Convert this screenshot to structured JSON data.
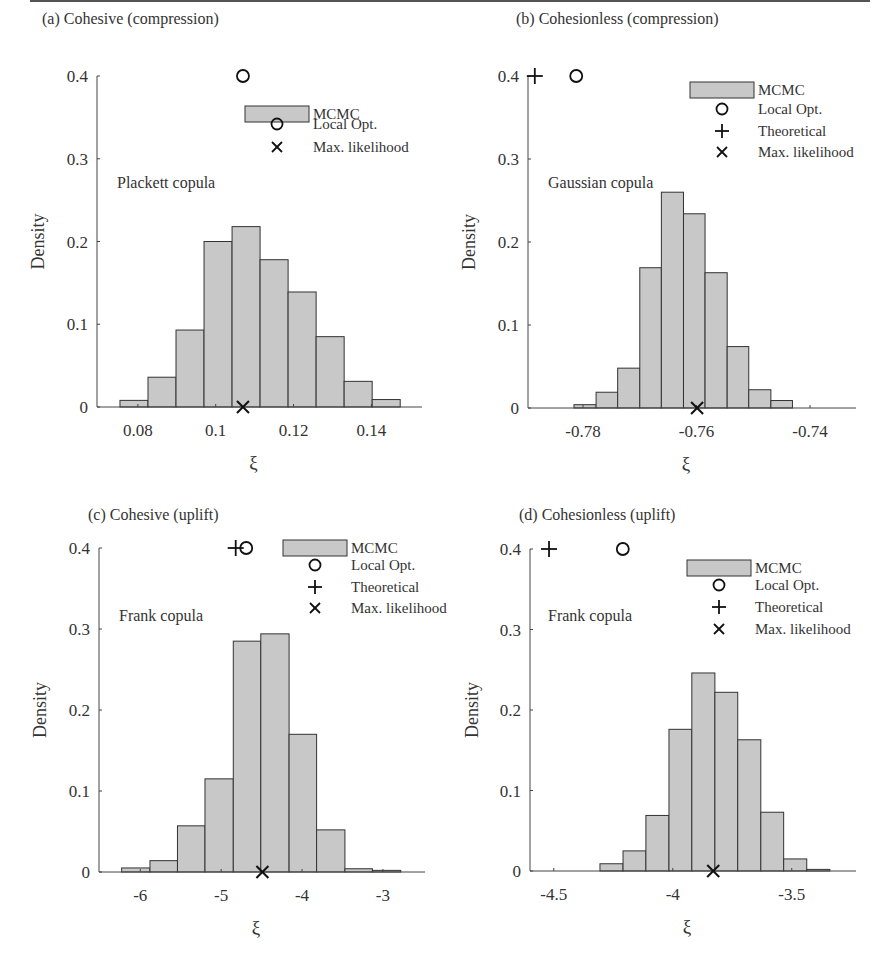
{
  "figure": {
    "ylabel": "Density",
    "xlabel": "ξ",
    "bar_fill": "#c8c8c8",
    "bar_stroke": "#333333",
    "legend": {
      "mcmc": "MCMC",
      "local_opt": "Local Opt.",
      "theoretical": "Theoretical",
      "max_likelihood": "Max. likelihood"
    }
  },
  "chart_data": [
    {
      "type": "bar",
      "panel": "a",
      "title": "(a) Cohesive (compression)",
      "annotation": "Plackett copula",
      "xlabel": "ξ",
      "ylabel": "Density",
      "ylim": [
        0,
        0.4
      ],
      "yticks": [
        0,
        0.1,
        0.2,
        0.3,
        0.4
      ],
      "xticks": [
        0.08,
        0.1,
        0.12,
        0.14
      ],
      "xtick_labels": [
        "0.08",
        "0.1",
        "0.12",
        "0.14"
      ],
      "xlim": [
        0.0695,
        0.153
      ],
      "bin_edges": [
        0.0754,
        0.0826,
        0.0898,
        0.097,
        0.1042,
        0.1114,
        0.1186,
        0.1258,
        0.133,
        0.1402,
        0.1474
      ],
      "values": [
        0.008,
        0.036,
        0.093,
        0.2,
        0.218,
        0.178,
        0.139,
        0.085,
        0.031,
        0.009
      ],
      "markers": {
        "local_opt": 0.107,
        "theoretical": null,
        "max_likelihood": 0.107
      },
      "legend_entries": [
        "MCMC",
        "Local Opt.",
        "Max. likelihood"
      ]
    },
    {
      "type": "bar",
      "panel": "b",
      "title": "(b) Cohesionless (compression)",
      "annotation": "Gaussian copula",
      "xlabel": "ξ",
      "ylabel": "Density",
      "ylim": [
        0,
        0.4
      ],
      "yticks": [
        0,
        0.1,
        0.2,
        0.3,
        0.4
      ],
      "xticks": [
        -0.78,
        -0.76,
        -0.74
      ],
      "xtick_labels": [
        "-0.78",
        "-0.76",
        "-0.74"
      ],
      "xlim": [
        -0.7897,
        -0.7319
      ],
      "bin_edges": [
        -0.7816,
        -0.7777,
        -0.7739,
        -0.77,
        -0.7662,
        -0.7623,
        -0.7585,
        -0.7546,
        -0.7508,
        -0.7469,
        -0.7431,
        -0.7392
      ],
      "values": [
        0.004,
        0.019,
        0.048,
        0.169,
        0.26,
        0.234,
        0.163,
        0.074,
        0.022,
        0.009,
        0.0
      ],
      "markers": {
        "local_opt": -0.7812,
        "theoretical": -0.7885,
        "max_likelihood": -0.7599
      },
      "legend_entries": [
        "MCMC",
        "Local Opt.",
        "Theoretical",
        "Max. likelihood"
      ]
    },
    {
      "type": "bar",
      "panel": "c",
      "title": "(c) Cohesive (uplift)",
      "annotation": "Frank copula",
      "xlabel": "ξ",
      "ylabel": "Density",
      "ylim": [
        0,
        0.4
      ],
      "yticks": [
        0,
        0.1,
        0.2,
        0.3,
        0.4
      ],
      "xticks": [
        -6,
        -5,
        -4,
        -3
      ],
      "xtick_labels": [
        "-6",
        "-5",
        "-4",
        "-3"
      ],
      "xlim": [
        -6.51,
        -2.48
      ],
      "bin_edges": [
        -6.23,
        -5.88,
        -5.54,
        -5.2,
        -4.85,
        -4.51,
        -4.16,
        -3.82,
        -3.47,
        -3.13,
        -2.78
      ],
      "values": [
        0.005,
        0.014,
        0.057,
        0.115,
        0.285,
        0.294,
        0.17,
        0.052,
        0.004,
        0.002
      ],
      "markers": {
        "local_opt": -4.69,
        "theoretical": -4.82,
        "max_likelihood": -4.49
      },
      "legend_entries": [
        "MCMC",
        "Local Opt.",
        "Theoretical",
        "Max. likelihood"
      ]
    },
    {
      "type": "bar",
      "panel": "d",
      "title": "(d) Cohesionless (uplift)",
      "annotation": "Frank copula",
      "xlabel": "ξ",
      "ylabel": "Density",
      "ylim": [
        0,
        0.4
      ],
      "yticks": [
        0,
        0.1,
        0.2,
        0.3,
        0.4
      ],
      "xticks": [
        -4.5,
        -4,
        -3.5
      ],
      "xtick_labels": [
        "-4.5",
        "-4",
        "-3.5"
      ],
      "xlim": [
        -4.6,
        -3.23
      ],
      "bin_edges": [
        -4.306,
        -4.209,
        -4.113,
        -4.016,
        -3.92,
        -3.823,
        -3.727,
        -3.63,
        -3.534,
        -3.437,
        -3.34
      ],
      "values": [
        0.009,
        0.025,
        0.069,
        0.176,
        0.246,
        0.222,
        0.163,
        0.073,
        0.015,
        0.002
      ],
      "markers": {
        "local_opt": -4.21,
        "theoretical": -4.52,
        "max_likelihood": -3.83
      },
      "legend_entries": [
        "MCMC",
        "Local Opt.",
        "Theoretical",
        "Max. likelihood"
      ]
    }
  ]
}
